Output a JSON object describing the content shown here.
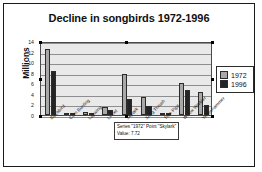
{
  "chart_data": {
    "type": "bar",
    "title": "Decline in songbirds 1972-1996",
    "xlabel": "",
    "ylabel": "Millions",
    "ylim": [
      0,
      14
    ],
    "yticks": [
      0,
      2,
      4,
      6,
      8,
      10,
      12,
      14
    ],
    "grid": true,
    "legend_position": "right",
    "categories": [
      "Blackbird",
      "Corn Bunting",
      "Lapwing",
      "Linnet",
      "Skylark",
      "Song Thrush",
      "Tree Pipit",
      "Willow Warbler",
      "Yellowhammer"
    ],
    "series": [
      {
        "name": "1972",
        "color": "#a8a8a8",
        "values": [
          12.5,
          0.05,
          0.6,
          1.6,
          7.72,
          3.5,
          0.15,
          6.1,
          4.4
        ]
      },
      {
        "name": "1996",
        "color": "#242424",
        "values": [
          8.4,
          0.03,
          0.4,
          0.9,
          3.1,
          1.8,
          0.05,
          4.7,
          1.9
        ]
      }
    ]
  },
  "legend": {
    "items": [
      {
        "label": "1972"
      },
      {
        "label": "1996"
      }
    ]
  },
  "tooltip": {
    "line1": "Series \"1972\" Point \"Skylark\"",
    "line2": "Value: 7.72"
  }
}
